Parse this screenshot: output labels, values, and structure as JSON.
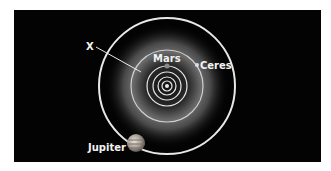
{
  "diagram": {
    "labels": {
      "x": "X",
      "mars": "Mars",
      "ceres": "Ceres",
      "jupiter": "Jupiter"
    },
    "colors": {
      "background": "#030303",
      "orbit": "#e8e8e8",
      "text": "#f2f2f2"
    }
  }
}
